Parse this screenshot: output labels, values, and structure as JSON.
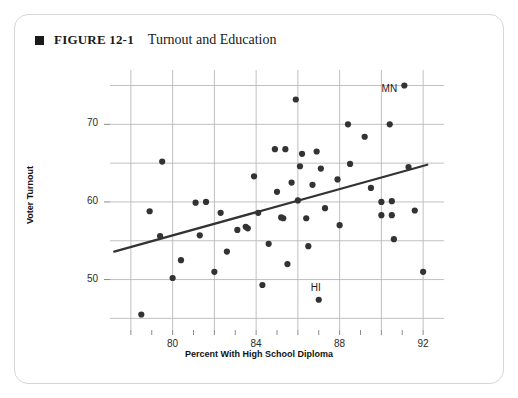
{
  "figure": {
    "bullet_icon": "black-square-icon",
    "number_label": "FIGURE 12-1",
    "title": "Turnout and Education"
  },
  "chart_data": {
    "type": "scatter",
    "title": "Turnout and Education",
    "xlabel": "Percent With High School Diploma",
    "ylabel": "Voter Turnout",
    "xlim": [
      77.0,
      93.0
    ],
    "ylim": [
      43.5,
      77.0
    ],
    "xticks": [
      80,
      84,
      88,
      92
    ],
    "xticklabels": [
      "80",
      "84",
      "88",
      "92"
    ],
    "xminorticks": [
      78,
      79,
      81,
      82,
      83,
      85,
      86,
      87,
      89,
      90,
      91
    ],
    "yticks": [
      50,
      60,
      70
    ],
    "yticklabels": [
      "50",
      "60",
      "70"
    ],
    "ygridlines": [
      45,
      50,
      55,
      60,
      65,
      70,
      75
    ],
    "xgridlines": [
      78,
      80,
      82,
      84,
      86,
      88,
      90,
      92
    ],
    "grid": true,
    "legend": "none",
    "point_color": "#333333",
    "point_radius": 3.1,
    "grid_color": "#b9b9b9",
    "trendline": {
      "color": "#333333",
      "width": 2.2,
      "x_start": 77.2,
      "y_start": 53.6,
      "x_end": 92.2,
      "y_end": 64.8
    },
    "annotations": [
      {
        "text": "MN",
        "x": 91.1,
        "y": 75.0,
        "dx": -17,
        "dy": 4
      },
      {
        "text": "HI",
        "x": 87.0,
        "y": 47.4,
        "dx": -5,
        "dy": -11
      }
    ],
    "points": [
      {
        "x": 78.5,
        "y": 45.5
      },
      {
        "x": 78.9,
        "y": 58.8
      },
      {
        "x": 79.4,
        "y": 55.6
      },
      {
        "x": 79.5,
        "y": 65.2
      },
      {
        "x": 80.0,
        "y": 50.2
      },
      {
        "x": 80.4,
        "y": 52.5
      },
      {
        "x": 81.1,
        "y": 59.9
      },
      {
        "x": 81.3,
        "y": 55.7
      },
      {
        "x": 81.6,
        "y": 60.0
      },
      {
        "x": 82.0,
        "y": 51.0
      },
      {
        "x": 82.3,
        "y": 58.6
      },
      {
        "x": 82.6,
        "y": 53.6
      },
      {
        "x": 83.1,
        "y": 56.4
      },
      {
        "x": 83.5,
        "y": 56.8
      },
      {
        "x": 83.6,
        "y": 56.6
      },
      {
        "x": 83.9,
        "y": 63.3
      },
      {
        "x": 84.1,
        "y": 58.6
      },
      {
        "x": 84.3,
        "y": 49.3
      },
      {
        "x": 84.6,
        "y": 54.6
      },
      {
        "x": 84.9,
        "y": 66.8
      },
      {
        "x": 85.0,
        "y": 61.3
      },
      {
        "x": 85.2,
        "y": 58.0
      },
      {
        "x": 85.3,
        "y": 57.9
      },
      {
        "x": 85.4,
        "y": 66.8
      },
      {
        "x": 85.5,
        "y": 52.0
      },
      {
        "x": 85.7,
        "y": 62.5
      },
      {
        "x": 85.9,
        "y": 73.2
      },
      {
        "x": 86.0,
        "y": 60.2
      },
      {
        "x": 86.1,
        "y": 64.6
      },
      {
        "x": 86.2,
        "y": 66.2
      },
      {
        "x": 86.4,
        "y": 57.9
      },
      {
        "x": 86.5,
        "y": 54.3
      },
      {
        "x": 86.7,
        "y": 62.2
      },
      {
        "x": 86.9,
        "y": 66.5
      },
      {
        "x": 87.0,
        "y": 47.4
      },
      {
        "x": 87.1,
        "y": 64.3
      },
      {
        "x": 87.3,
        "y": 59.2
      },
      {
        "x": 87.9,
        "y": 62.9
      },
      {
        "x": 88.0,
        "y": 57.0
      },
      {
        "x": 88.4,
        "y": 70.0
      },
      {
        "x": 88.5,
        "y": 64.9
      },
      {
        "x": 89.2,
        "y": 68.4
      },
      {
        "x": 89.5,
        "y": 61.8
      },
      {
        "x": 90.0,
        "y": 60.0
      },
      {
        "x": 90.0,
        "y": 58.3
      },
      {
        "x": 90.4,
        "y": 70.0
      },
      {
        "x": 90.5,
        "y": 60.1
      },
      {
        "x": 90.5,
        "y": 58.3
      },
      {
        "x": 90.6,
        "y": 55.2
      },
      {
        "x": 91.1,
        "y": 75.0
      },
      {
        "x": 91.3,
        "y": 64.5
      },
      {
        "x": 91.6,
        "y": 58.9
      },
      {
        "x": 92.0,
        "y": 51.0
      }
    ]
  }
}
